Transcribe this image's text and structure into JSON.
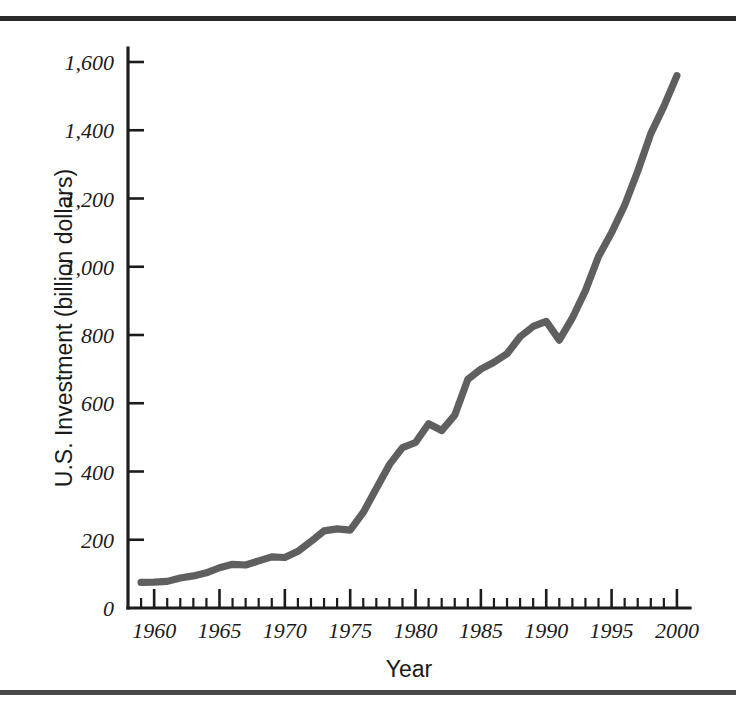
{
  "figure": {
    "background_color": "#ffffff",
    "rule_color_top": "#2b2b2b",
    "rule_color_bottom": "#4a4a4a"
  },
  "chart_data": {
    "type": "line",
    "title": "",
    "subtitle": "",
    "xlabel": "Year",
    "ylabel": "U.S. Investment (billion dollars)",
    "xlim": [
      1958,
      2001
    ],
    "ylim": [
      0,
      1700
    ],
    "grid": false,
    "legend": false,
    "legend_position": "none",
    "line_color": "#5f5f5f",
    "axis_color": "#1c1c1c",
    "x_ticks_major": [
      1960,
      1965,
      1970,
      1975,
      1980,
      1985,
      1990,
      1995,
      2000
    ],
    "x_tick_labels": [
      "1960",
      "1965",
      "1970",
      "1975",
      "1980",
      "1985",
      "1990",
      "1995",
      "2000"
    ],
    "x_minor_tick_step": 1,
    "y_ticks_major": [
      0,
      200,
      400,
      600,
      800,
      1000,
      1200,
      1400,
      1600
    ],
    "y_tick_labels": [
      "0",
      "200",
      "400",
      "600",
      "800",
      "1,000",
      "1,200",
      "1,400",
      "1,600"
    ],
    "series": [
      {
        "name": "U.S. Investment",
        "x": [
          1959,
          1960,
          1961,
          1962,
          1963,
          1964,
          1965,
          1966,
          1967,
          1968,
          1969,
          1970,
          1971,
          1972,
          1973,
          1974,
          1975,
          1976,
          1977,
          1978,
          1979,
          1980,
          1981,
          1982,
          1983,
          1984,
          1985,
          1986,
          1987,
          1988,
          1989,
          1990,
          1991,
          1992,
          1993,
          1994,
          1995,
          1996,
          1997,
          1998,
          1999,
          2000
        ],
        "values": [
          75,
          76,
          78,
          88,
          94,
          103,
          118,
          128,
          126,
          138,
          150,
          148,
          166,
          195,
          226,
          232,
          228,
          280,
          350,
          420,
          470,
          485,
          540,
          520,
          565,
          670,
          700,
          720,
          745,
          795,
          825,
          840,
          785,
          850,
          930,
          1030,
          1100,
          1180,
          1280,
          1390,
          1470,
          1560
        ]
      }
    ]
  }
}
